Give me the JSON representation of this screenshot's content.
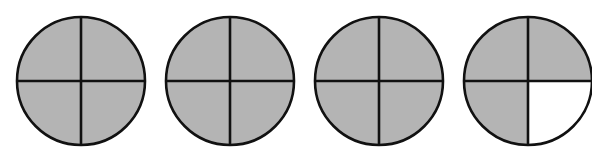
{
  "colors": {
    "shaded": "#b4b4b4",
    "unshaded": "#ffffff",
    "stroke": "#111111"
  },
  "figure": {
    "parts_per_whole": 4,
    "circles": [
      {
        "label": "circle-1",
        "shaded_quarters": [
          "top-left",
          "top-right",
          "bottom-left",
          "bottom-right"
        ],
        "shaded_count": 4
      },
      {
        "label": "circle-2",
        "shaded_quarters": [
          "top-left",
          "top-right",
          "bottom-left",
          "bottom-right"
        ],
        "shaded_count": 4
      },
      {
        "label": "circle-3",
        "shaded_quarters": [
          "top-left",
          "top-right",
          "bottom-left",
          "bottom-right"
        ],
        "shaded_count": 4
      },
      {
        "label": "circle-4",
        "shaded_quarters": [
          "top-left",
          "top-right",
          "bottom-left"
        ],
        "shaded_count": 3
      }
    ],
    "total_shaded_parts": 15
  }
}
